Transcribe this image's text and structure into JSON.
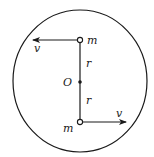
{
  "diagram": {
    "type": "physics-rotating-masses",
    "circle": {
      "cx": 80,
      "cy": 81,
      "rx": 67,
      "ry": 71
    },
    "center": {
      "label": "O",
      "x": 80,
      "y": 82
    },
    "rod": {
      "x": 80,
      "y_top": 40,
      "y_bottom": 122
    },
    "masses": [
      {
        "label": "m",
        "x": 80,
        "y": 40,
        "velocity_label": "v",
        "direction": "left"
      },
      {
        "label": "m",
        "x": 80,
        "y": 122,
        "velocity_label": "v",
        "direction": "right"
      }
    ],
    "radius_labels": [
      "r",
      "r"
    ],
    "colors": {
      "stroke": "#1a1a1a",
      "background": "#ffffff"
    }
  }
}
